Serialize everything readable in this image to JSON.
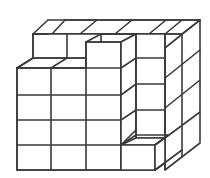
{
  "figure": {
    "title": "Stack of unit cubes",
    "colors": {
      "line": "#3a3a3a",
      "background": "#ffffff"
    }
  }
}
